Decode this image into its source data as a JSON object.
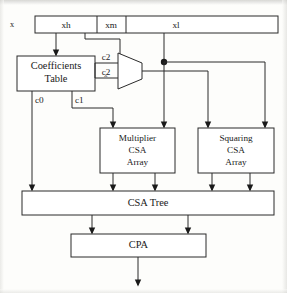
{
  "figure": {
    "operand_label": "x",
    "ink_color": "#2a2a2a",
    "paper_color": "#fdfdfb"
  },
  "operand_bar": {
    "name": "x",
    "fields": [
      {
        "label": "xh",
        "desc": "high part of operand"
      },
      {
        "label": "xm",
        "desc": "middle part of operand"
      },
      {
        "label": "xl",
        "desc": "low part of operand"
      }
    ]
  },
  "blocks": [
    {
      "id": "coefficients-table",
      "lines": [
        "Coefficients",
        "Table"
      ]
    },
    {
      "id": "multiplier-csa-array",
      "lines": [
        "Multiplier",
        "CSA",
        "Array"
      ]
    },
    {
      "id": "squaring-csa-array",
      "lines": [
        "Squaring",
        "CSA",
        "Array"
      ]
    },
    {
      "id": "csa-tree",
      "lines": [
        "CSA   Tree"
      ]
    },
    {
      "id": "cpa",
      "lines": [
        "CPA"
      ]
    }
  ],
  "block_labels": {
    "coefficients_line1": "Coefficients",
    "coefficients_line2": "Table",
    "multiplier_line1": "Multiplier",
    "multiplier_line2": "CSA",
    "multiplier_line3": "Array",
    "squaring_line1": "Squaring",
    "squaring_line2": "CSA",
    "squaring_line3": "Array",
    "csa_tree": "CSA   Tree",
    "cpa": "CPA"
  },
  "signals": [
    {
      "label": "c2",
      "desc": "coefficient c2, upper mux input"
    },
    {
      "label": "c˜2",
      "desc": "coefficient c2 tilde, lower mux input"
    },
    {
      "label": "c0",
      "desc": "coefficient c0 to CSA Tree"
    },
    {
      "label": "c1",
      "desc": "coefficient c1 to Multiplier CSA Array"
    }
  ],
  "signal_labels": {
    "c2": "c2",
    "c2_tilde": "c̭2",
    "c0": "c0",
    "c1": "c1"
  },
  "mux": {
    "id": "coefficient-mux",
    "inputs": [
      "c2",
      "c̭2"
    ],
    "select_source": "xm"
  }
}
